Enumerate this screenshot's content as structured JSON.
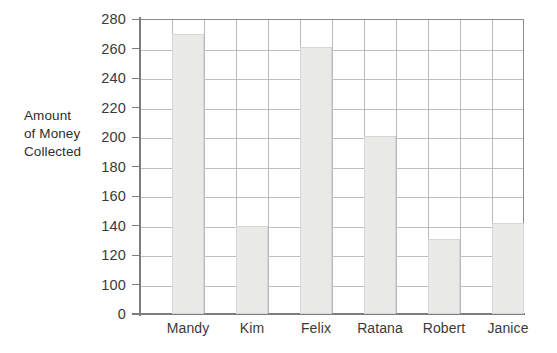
{
  "chart_data": {
    "type": "bar",
    "title": "",
    "subtitle": "",
    "xlabel": "",
    "ylabel": "Amount of Money Collected",
    "ylabel_lines": [
      "Amount",
      "of Money",
      "Collected"
    ],
    "categories": [
      "Mandy",
      "Kim",
      "Felix",
      "Ratana",
      "Robert",
      "Janice"
    ],
    "values": [
      270,
      140,
      261,
      201,
      131,
      142
    ],
    "ylim": [
      0,
      280
    ],
    "y_ticks": [
      280,
      260,
      240,
      220,
      200,
      180,
      160,
      140,
      120,
      100,
      0
    ],
    "y_tick_labels": [
      "280",
      "260",
      "240",
      "220",
      "200",
      "180",
      "160",
      "140",
      "120",
      "100",
      "0"
    ],
    "axis_break": true,
    "axis_break_note": "y-axis jumps from 100 to 0 at the baseline",
    "grid": true,
    "grid_vertical_columns": 12,
    "legend": null,
    "legend_position": "none",
    "bar_fill_color": "#e9e9e7",
    "bar_border_color": "#d6d6d3",
    "grid_color": "#bfbfbf",
    "axis_color": "#7d7d7d",
    "text_color": "#3a3a3a",
    "background_color": "#ffffff"
  }
}
